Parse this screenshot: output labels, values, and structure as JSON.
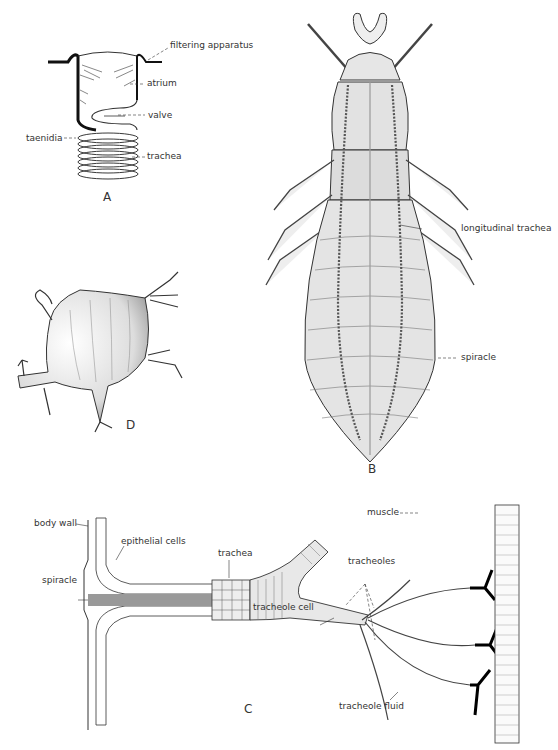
{
  "figure": {
    "panels": [
      {
        "id": "A",
        "label": "A",
        "labels": [
          "filtering apparatus",
          "atrium",
          "valve",
          "taenidia",
          "trachea"
        ]
      },
      {
        "id": "B",
        "label": "B",
        "labels": [
          "longitudinal trachea",
          "spiracle"
        ]
      },
      {
        "id": "C",
        "label": "C",
        "labels": [
          "body wall",
          "epithelial cells",
          "spiracle",
          "trachea",
          "tracheoles",
          "muscle",
          "tracheole cell",
          "tracheole fluid"
        ]
      },
      {
        "id": "D",
        "label": "D",
        "labels": []
      }
    ]
  },
  "panelA": {
    "letter": "A",
    "filtering_apparatus": "filtering apparatus",
    "atrium": "atrium",
    "valve": "valve",
    "taenidia": "taenidia",
    "trachea": "trachea"
  },
  "panelB": {
    "letter": "B",
    "longitudinal_trachea": "longitudinal trachea",
    "spiracle": "spiracle"
  },
  "panelC": {
    "letter": "C",
    "body_wall": "body wall",
    "epithelial_cells": "epithelial cells",
    "spiracle": "spiracle",
    "trachea": "trachea",
    "tracheoles": "tracheoles",
    "muscle": "muscle",
    "tracheole_cell": "tracheole cell",
    "tracheole_fluid": "tracheole fluid"
  },
  "panelD": {
    "letter": "D"
  }
}
